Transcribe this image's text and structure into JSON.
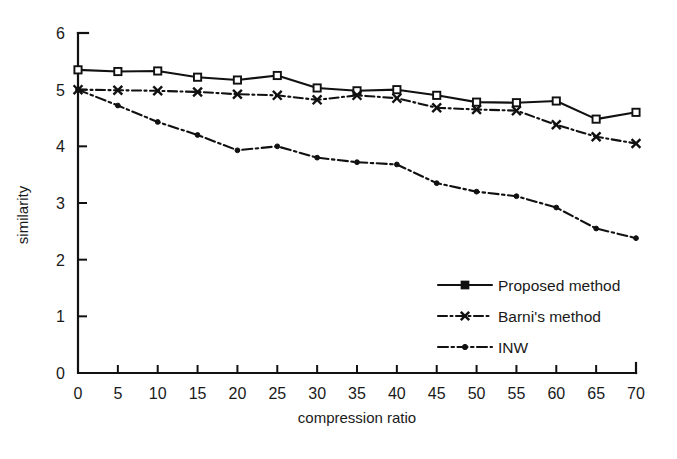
{
  "chart_data": {
    "type": "line",
    "title": "",
    "xlabel": "compression ratio",
    "ylabel": "similarity",
    "xlim": [
      0,
      70
    ],
    "ylim": [
      0,
      6
    ],
    "xticks": [
      0,
      5,
      10,
      15,
      20,
      25,
      30,
      35,
      40,
      45,
      50,
      55,
      60,
      65,
      70
    ],
    "yticks": [
      0,
      1,
      2,
      3,
      4,
      5,
      6
    ],
    "grid": false,
    "legend_position": "lower right",
    "x": [
      0,
      5,
      10,
      15,
      20,
      25,
      30,
      35,
      40,
      45,
      50,
      55,
      60,
      65,
      70
    ],
    "series": [
      {
        "name": "Proposed method",
        "marker": "square",
        "linestyle": "solid",
        "values": [
          5.35,
          5.32,
          5.33,
          5.22,
          5.17,
          5.25,
          5.03,
          4.98,
          5.0,
          4.9,
          4.78,
          4.77,
          4.8,
          4.48,
          4.6
        ]
      },
      {
        "name": "Barni's method",
        "marker": "x",
        "linestyle": "dash-dot",
        "values": [
          5.0,
          4.99,
          4.98,
          4.96,
          4.92,
          4.9,
          4.82,
          4.9,
          4.85,
          4.68,
          4.65,
          4.63,
          4.38,
          4.17,
          4.05
        ]
      },
      {
        "name": "INW",
        "marker": "dot",
        "linestyle": "dash-dot",
        "values": [
          5.0,
          4.72,
          4.43,
          4.2,
          3.93,
          4.0,
          3.8,
          3.72,
          3.68,
          3.35,
          3.2,
          3.12,
          2.92,
          2.55,
          2.38
        ]
      }
    ],
    "xticklabels": [
      "0",
      "5",
      "10",
      "15",
      "20",
      "25",
      "30",
      "35",
      "40",
      "45",
      "50",
      "55",
      "60",
      "65",
      "70"
    ],
    "yticklabels": [
      "0",
      "1",
      "2",
      "3",
      "4",
      "5",
      "6"
    ],
    "legend_entries": [
      "Proposed method",
      "Barni's method",
      "INW"
    ]
  },
  "axes": {
    "x_title": "compression ratio",
    "y_title": "similarity"
  }
}
